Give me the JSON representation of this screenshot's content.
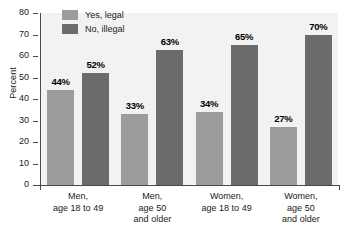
{
  "chart_data": {
    "type": "bar",
    "title": "",
    "xlabel": "",
    "ylabel": "Percent",
    "ylim": [
      0,
      80
    ],
    "ytick_step": 10,
    "yticks": [
      "80",
      "70",
      "60",
      "50",
      "40",
      "30",
      "20",
      "10",
      "0"
    ],
    "grid": false,
    "legend_position": "top-left-inside",
    "categories": [
      "Men,\nage 18 to 49",
      "Men,\nage 50\nand older",
      "Women,\nage 18 to 49",
      "Women,\nage 50\nand older"
    ],
    "category_lines": [
      [
        "Men,",
        "age 18 to 49"
      ],
      [
        "Men,",
        "age 50",
        "and older"
      ],
      [
        "Women,",
        "age 18 to 49"
      ],
      [
        "Women,",
        "age 50",
        "and older"
      ]
    ],
    "series": [
      {
        "name": "Yes, legal",
        "color": "#9c9c9c",
        "values": [
          44,
          33,
          34,
          27
        ],
        "value_labels": [
          "44%",
          "52%",
          "33%",
          "34%",
          "27%"
        ]
      },
      {
        "name": "No, illegal",
        "color": "#6b6b6b",
        "values": [
          52,
          63,
          65,
          70
        ]
      }
    ],
    "bar_labels": {
      "legal": [
        "44%",
        "33%",
        "34%",
        "27%"
      ],
      "illegal": [
        "52%",
        "63%",
        "65%",
        "70%"
      ]
    }
  },
  "legend": {
    "items": [
      {
        "label": "Yes, legal",
        "key": "legal"
      },
      {
        "label": "No, illegal",
        "key": "illegal"
      }
    ]
  },
  "colors": {
    "legal": "#9c9c9c",
    "illegal": "#6b6b6b",
    "plot_background": "#f2f2f2",
    "axis": "#4a4a4a",
    "text": "#1a1a1a"
  }
}
